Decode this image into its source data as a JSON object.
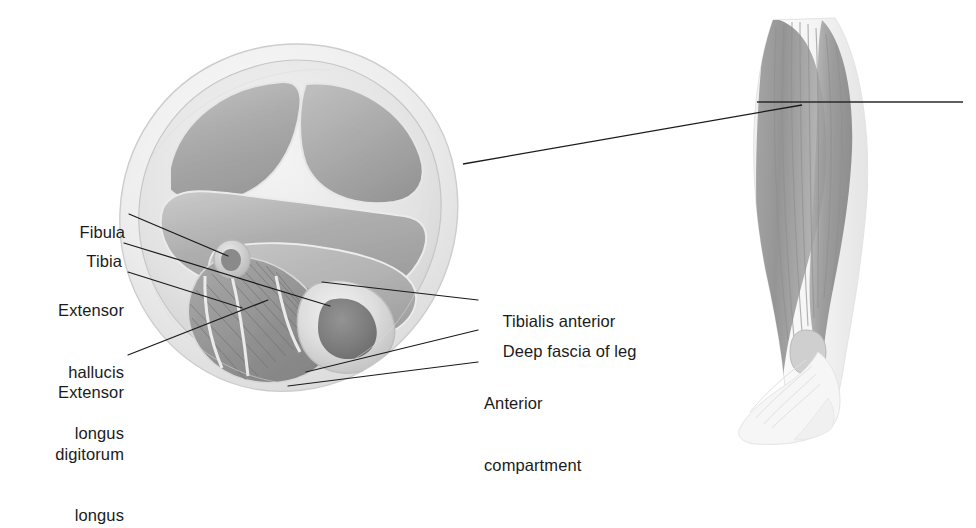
{
  "figure": {
    "kind": "anatomical-illustration",
    "views": {
      "cross_section": "Transverse (axial) section of the right leg",
      "whole_leg": "Anterolateral view of the leg and foot with section plane indicated"
    }
  },
  "labels": {
    "left": [
      {
        "id": "fibula",
        "text": "Fibula",
        "lines": [
          "Fibula"
        ]
      },
      {
        "id": "tibia",
        "text": "Tibia",
        "lines": [
          "Tibia"
        ]
      },
      {
        "id": "extensor-hallucis-longus",
        "text": "Extensor hallucis longus",
        "lines": [
          "Extensor",
          "hallucis",
          "longus"
        ]
      },
      {
        "id": "extensor-digitorum-longus",
        "text": "Extensor digitorum longus",
        "lines": [
          "Extensor",
          "digitorum",
          "longus"
        ]
      }
    ],
    "right": [
      {
        "id": "tibialis-anterior",
        "text": "Tibialis anterior",
        "lines": [
          "Tibialis anterior"
        ]
      },
      {
        "id": "deep-fascia-of-leg",
        "text": "Deep fascia of leg",
        "lines": [
          "Deep fascia of leg"
        ]
      },
      {
        "id": "anterior-compartment",
        "text": "Anterior compartment",
        "lines": [
          "Anterior",
          "compartment"
        ]
      }
    ]
  },
  "label_text": {
    "fibula": "Fibula",
    "tibia": "Tibia",
    "ehl_1": "Extensor",
    "ehl_2": "hallucis",
    "ehl_3": "longus",
    "edl_1": "Extensor",
    "edl_2": "digitorum",
    "edl_3": "longus",
    "tibialis_anterior": "Tibialis anterior",
    "deep_fascia": "Deep fascia of leg",
    "ant_comp_1": "Anterior",
    "ant_comp_2": "compartment"
  },
  "colors": {
    "text": "#1b1b1b",
    "leader_line": "#1a1a1a",
    "background": "#ffffff",
    "skin_outer": "#e6e6e6",
    "fascia": "#d2d2d2",
    "muscle_mid": "#b0b0b0",
    "muscle_dark": "#8c8c8c",
    "bone_cortex": "#dcdcdc",
    "bone_marrow": "#7a7a7a",
    "septum": "#f0f0f0"
  }
}
